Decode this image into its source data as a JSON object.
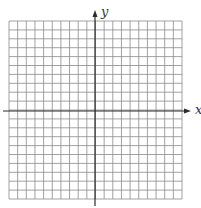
{
  "diagram": {
    "type": "coordinate-grid",
    "grid": {
      "columns": 20,
      "rows": 20,
      "left": 9,
      "top": 21,
      "right": 182,
      "bottom": 199,
      "line_color": "#8a8a8a"
    },
    "axes": {
      "color": "#2b2b2b",
      "x_axis": {
        "label": "x",
        "y": 111,
        "from": 3,
        "to": 191
      },
      "y_axis": {
        "label": "y",
        "x": 95,
        "from": 206,
        "to": 10
      }
    }
  }
}
